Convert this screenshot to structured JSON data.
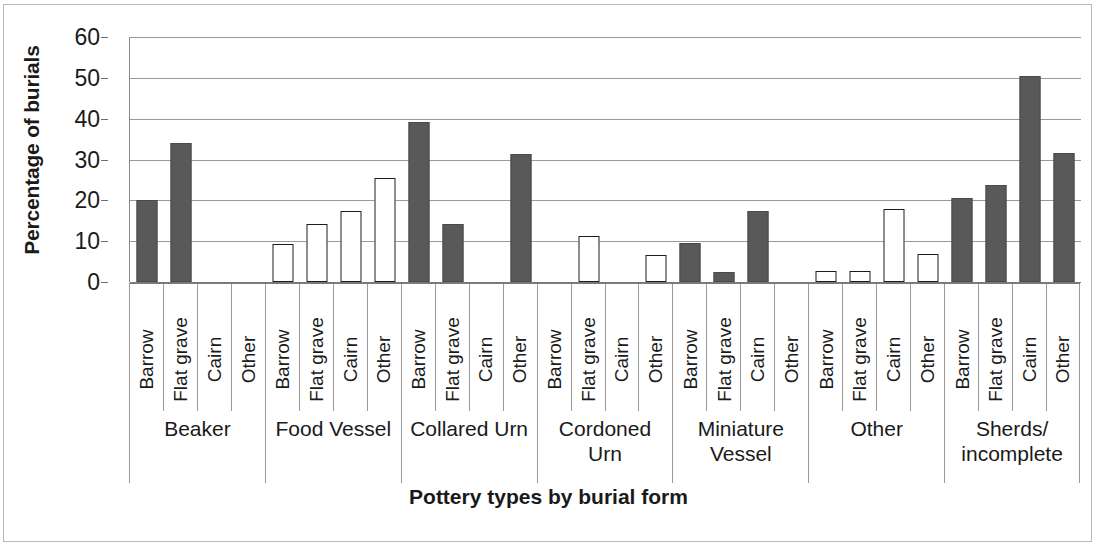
{
  "chart_data": {
    "type": "bar",
    "title": "",
    "xlabel": "Pottery types by burial form",
    "ylabel": "Percentage of burials",
    "ylim": [
      0,
      60
    ],
    "yticks": [
      0,
      10,
      20,
      30,
      40,
      50,
      60
    ],
    "grid": true,
    "legend": "none",
    "categories": [
      "Barrow",
      "Flat grave",
      "Cairn",
      "Other"
    ],
    "groups": [
      {
        "label": "Beaker",
        "values": [
          20.0,
          34.0,
          0,
          0
        ],
        "styles": [
          "filled",
          "filled",
          "none",
          "none"
        ]
      },
      {
        "label": "Food Vessel",
        "values": [
          9.2,
          14.3,
          17.3,
          25.5
        ],
        "styles": [
          "hollow",
          "hollow",
          "hollow",
          "hollow"
        ]
      },
      {
        "label": "Collared Urn",
        "values": [
          39.3,
          14.3,
          0,
          31.3
        ],
        "styles": [
          "filled",
          "filled",
          "none",
          "filled"
        ]
      },
      {
        "label": "Cordoned\nUrn",
        "values": [
          0,
          11.3,
          0,
          6.5
        ],
        "styles": [
          "none",
          "hollow",
          "none",
          "hollow"
        ]
      },
      {
        "label": "Miniature\nVessel",
        "values": [
          9.5,
          2.5,
          17.5,
          0
        ],
        "styles": [
          "filled",
          "filled",
          "filled",
          "none"
        ]
      },
      {
        "label": "Other",
        "values": [
          2.7,
          2.7,
          17.8,
          6.8
        ],
        "styles": [
          "hollow",
          "hollow",
          "hollow",
          "hollow"
        ]
      },
      {
        "label": "Sherds/\nincomplete",
        "values": [
          20.6,
          23.7,
          50.5,
          31.5
        ],
        "styles": [
          "filled",
          "filled",
          "filled",
          "filled"
        ]
      }
    ],
    "colors": {
      "filled_bar": "#595959",
      "hollow_bar_fill": "#ffffff",
      "hollow_bar_border": "#1d1d1d",
      "gridline": "#9a9a9a",
      "axis": "#7a7a7a",
      "text": "#1a1a1a",
      "frame": "#b8b8b8"
    }
  }
}
